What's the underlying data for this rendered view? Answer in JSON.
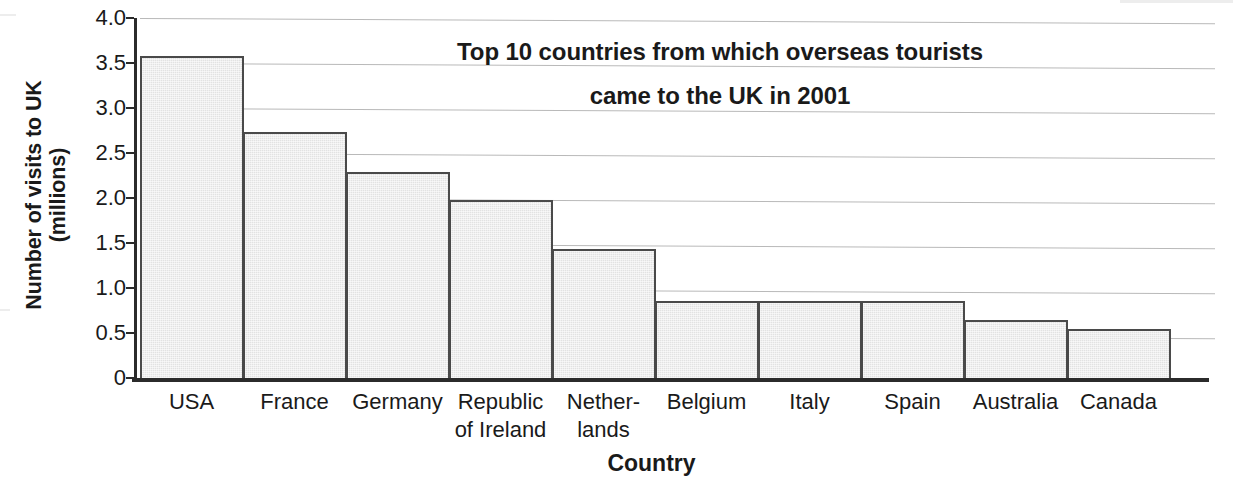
{
  "chart_data": {
    "type": "bar",
    "title": "Top 10 countries from which overseas tourists came to the UK in 2001",
    "title_lines": [
      "Top 10 countries from which overseas tourists",
      "came to the UK in 2001"
    ],
    "xlabel": "Country",
    "ylabel": "Number of visits to UK (millions)",
    "ylabel_lines": [
      "Number of visits to UK",
      "(millions)"
    ],
    "categories": [
      "USA",
      "France",
      "Germany",
      "Republic\nof Ireland",
      "Nether-\nlands",
      "Belgium",
      "Italy",
      "Spain",
      "Australia",
      "Canada"
    ],
    "values": [
      3.58,
      2.73,
      2.29,
      1.98,
      1.43,
      0.86,
      0.86,
      0.86,
      0.65,
      0.55
    ],
    "ylim": [
      0,
      4.0
    ],
    "ytick_values": [
      4.0,
      3.5,
      3.0,
      2.5,
      2.0,
      1.5,
      1.0,
      0.5,
      0
    ],
    "ytick_labels": [
      "4.0",
      "3.5",
      "3.0",
      "2.5",
      "2.0",
      "1.5",
      "1.0",
      "0.5",
      "0"
    ],
    "grid": true,
    "legend": null,
    "bar_fill_color": "#e2e2e2",
    "bar_edge_color": "#4a4a4a",
    "grid_color": "#b9b9b9",
    "axis_color": "#2b2b2b"
  }
}
